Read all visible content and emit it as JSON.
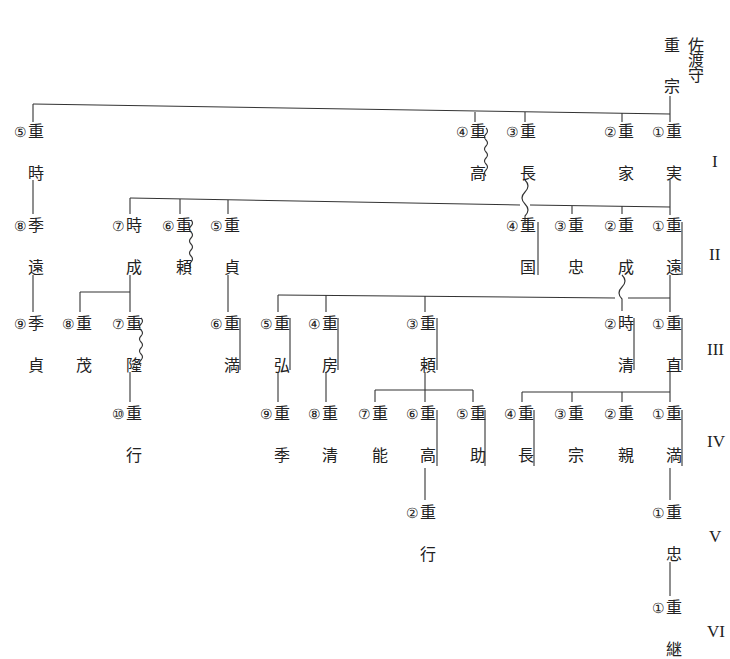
{
  "root": {
    "name_chars": [
      "重",
      "宗"
    ],
    "title_chars": [
      "佐",
      "渡",
      "守"
    ]
  },
  "generations": [
    "I",
    "II",
    "III",
    "IV",
    "V",
    "VI"
  ],
  "nodes": [
    {
      "id": "g1-5",
      "num": "⑤",
      "top": "重",
      "bottom": "時",
      "x": 36,
      "y": 124
    },
    {
      "id": "g1-4",
      "num": "④",
      "top": "重",
      "bottom": "高",
      "x": 478,
      "y": 124
    },
    {
      "id": "g1-3",
      "num": "③",
      "top": "重",
      "bottom": "長",
      "x": 528,
      "y": 124
    },
    {
      "id": "g1-2",
      "num": "②",
      "top": "重",
      "bottom": "家",
      "x": 626,
      "y": 124
    },
    {
      "id": "g1-1",
      "num": "①",
      "top": "重",
      "bottom": "実",
      "x": 674,
      "y": 124
    },
    {
      "id": "g2-l8",
      "num": "⑧",
      "top": "季",
      "bottom": "遠",
      "x": 36,
      "y": 218
    },
    {
      "id": "g2-7",
      "num": "⑦",
      "top": "時",
      "bottom": "成",
      "x": 134,
      "y": 218
    },
    {
      "id": "g2-6",
      "num": "⑥",
      "top": "重",
      "bottom": "頼",
      "x": 184,
      "y": 218
    },
    {
      "id": "g2-5",
      "num": "⑤",
      "top": "重",
      "bottom": "貞",
      "x": 232,
      "y": 218
    },
    {
      "id": "g2-4",
      "num": "④",
      "top": "重",
      "bottom": "国",
      "x": 528,
      "y": 218
    },
    {
      "id": "g2-3",
      "num": "③",
      "top": "重",
      "bottom": "忠",
      "x": 576,
      "y": 218
    },
    {
      "id": "g2-2",
      "num": "②",
      "top": "重",
      "bottom": "成",
      "x": 626,
      "y": 218
    },
    {
      "id": "g2-1",
      "num": "①",
      "top": "重",
      "bottom": "遠",
      "x": 674,
      "y": 218
    },
    {
      "id": "g3-l9",
      "num": "⑨",
      "top": "季",
      "bottom": "貞",
      "x": 36,
      "y": 316
    },
    {
      "id": "g3-l8",
      "num": "⑧",
      "top": "重",
      "bottom": "茂",
      "x": 84,
      "y": 316
    },
    {
      "id": "g3-l7",
      "num": "⑦",
      "top": "重",
      "bottom": "隆",
      "x": 134,
      "y": 316
    },
    {
      "id": "g3-l6",
      "num": "⑥",
      "top": "重",
      "bottom": "満",
      "x": 232,
      "y": 316
    },
    {
      "id": "g3-5",
      "num": "⑤",
      "top": "重",
      "bottom": "弘",
      "x": 282,
      "y": 316
    },
    {
      "id": "g3-4",
      "num": "④",
      "top": "重",
      "bottom": "房",
      "x": 330,
      "y": 316
    },
    {
      "id": "g3-3",
      "num": "③",
      "top": "重",
      "bottom": "頼",
      "x": 428,
      "y": 316
    },
    {
      "id": "g3-2",
      "num": "②",
      "top": "時",
      "bottom": "清",
      "x": 626,
      "y": 316
    },
    {
      "id": "g3-1",
      "num": "①",
      "top": "重",
      "bottom": "直",
      "x": 674,
      "y": 316
    },
    {
      "id": "g4-l10",
      "num": "⑩",
      "top": "重",
      "bottom": "行",
      "x": 134,
      "y": 406
    },
    {
      "id": "g4-9",
      "num": "⑨",
      "top": "重",
      "bottom": "季",
      "x": 282,
      "y": 406
    },
    {
      "id": "g4-8",
      "num": "⑧",
      "top": "重",
      "bottom": "清",
      "x": 330,
      "y": 406
    },
    {
      "id": "g4-7",
      "num": "⑦",
      "top": "重",
      "bottom": "能",
      "x": 380,
      "y": 406
    },
    {
      "id": "g4-6",
      "num": "⑥",
      "top": "重",
      "bottom": "高",
      "x": 428,
      "y": 406
    },
    {
      "id": "g4-5",
      "num": "⑤",
      "top": "重",
      "bottom": "助",
      "x": 478,
      "y": 406
    },
    {
      "id": "g4-4",
      "num": "④",
      "top": "重",
      "bottom": "長",
      "x": 526,
      "y": 406
    },
    {
      "id": "g4-3",
      "num": "③",
      "top": "重",
      "bottom": "宗",
      "x": 576,
      "y": 406
    },
    {
      "id": "g4-2",
      "num": "②",
      "top": "重",
      "bottom": "親",
      "x": 626,
      "y": 406
    },
    {
      "id": "g4-1",
      "num": "①",
      "top": "重",
      "bottom": "満",
      "x": 674,
      "y": 406
    },
    {
      "id": "g5-2",
      "num": "②",
      "top": "重",
      "bottom": "行",
      "x": 428,
      "y": 505
    },
    {
      "id": "g5-1",
      "num": "①",
      "top": "重",
      "bottom": "忠",
      "x": 674,
      "y": 505
    },
    {
      "id": "g6-1",
      "num": "①",
      "top": "重",
      "bottom": "継",
      "x": 674,
      "y": 600
    }
  ]
}
